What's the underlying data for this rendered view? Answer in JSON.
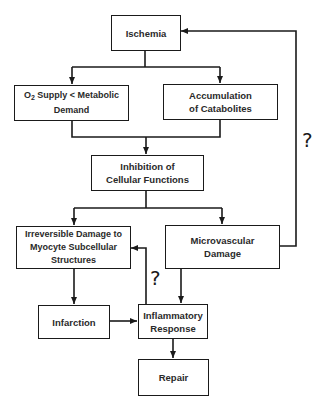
{
  "diagram": {
    "nodes": [
      {
        "id": "ischemia",
        "lines": [
          "Ischemia"
        ]
      },
      {
        "id": "o2-supply",
        "prefix": "O",
        "sub": "2",
        "lines": [
          " Supply < Metabolic",
          "Demand"
        ]
      },
      {
        "id": "catabolites",
        "lines": [
          "Accumulation",
          "of Catabolites"
        ]
      },
      {
        "id": "inhibition",
        "lines": [
          "Inhibition of",
          "Cellular Functions"
        ]
      },
      {
        "id": "irreversible",
        "lines": [
          "Irreversible Damage to",
          "Myocyte Subcellular",
          "Structures"
        ]
      },
      {
        "id": "microvascular",
        "lines": [
          "Microvascular",
          "Damage"
        ]
      },
      {
        "id": "infarction",
        "lines": [
          "Infarction"
        ]
      },
      {
        "id": "inflammatory",
        "lines": [
          "Inflammatory",
          "Response"
        ]
      },
      {
        "id": "repair",
        "lines": [
          "Repair"
        ]
      }
    ],
    "edges": [
      {
        "from": "ischemia",
        "to": "o2-supply"
      },
      {
        "from": "ischemia",
        "to": "catabolites"
      },
      {
        "from": "o2-supply",
        "to": "inhibition"
      },
      {
        "from": "catabolites",
        "to": "inhibition"
      },
      {
        "from": "inhibition",
        "to": "irreversible"
      },
      {
        "from": "inhibition",
        "to": "microvascular"
      },
      {
        "from": "microvascular",
        "to": "ischemia",
        "label": "?"
      },
      {
        "from": "irreversible",
        "to": "infarction"
      },
      {
        "from": "infarction",
        "to": "inflammatory"
      },
      {
        "from": "microvascular",
        "to": "inflammatory"
      },
      {
        "from": "inflammatory",
        "to": "irreversible",
        "label": "?"
      },
      {
        "from": "inflammatory",
        "to": "repair"
      }
    ],
    "annotations": {
      "feedback_right": "?",
      "feedback_left": "?"
    },
    "colors": {
      "line": "#1a1a1a",
      "background": "#ffffff"
    }
  }
}
